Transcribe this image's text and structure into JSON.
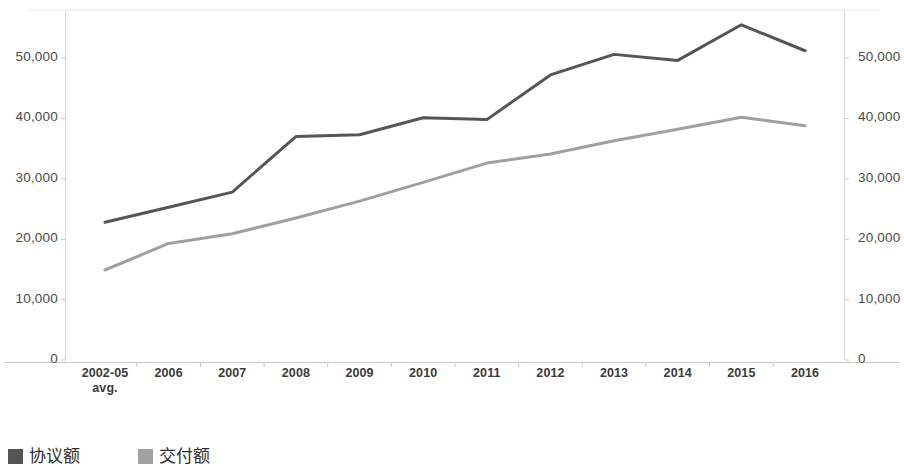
{
  "chart_data": {
    "type": "line",
    "title": "",
    "xlabel": "",
    "ylabel": "",
    "ylim": [
      0,
      55000
    ],
    "grid": false,
    "legend_position": "bottom-left",
    "dual_axis": true,
    "categories": [
      "2002-05\navg.",
      "2006",
      "2007",
      "2008",
      "2009",
      "2010",
      "2011",
      "2012",
      "2013",
      "2014",
      "2015",
      "2016"
    ],
    "series": [
      {
        "name": "协议额",
        "color": "#555555",
        "values": [
          22800,
          25300,
          27800,
          37000,
          37300,
          40100,
          39800,
          47200,
          50600,
          49600,
          55500,
          51200
        ]
      },
      {
        "name": "交付额",
        "color": "#a0a0a0",
        "values": [
          14900,
          19300,
          20900,
          23500,
          26300,
          29400,
          32600,
          34100,
          36300,
          38200,
          40200,
          38800
        ]
      }
    ],
    "yticks": [
      "0",
      "10,000",
      "20,000",
      "30,000",
      "40,000",
      "50,000"
    ],
    "ytick_values": [
      0,
      10000,
      20000,
      30000,
      40000,
      50000
    ]
  },
  "axes": {
    "left_ticks": [
      "50,000",
      "40,000",
      "30,000",
      "20,000",
      "10,000",
      "0"
    ],
    "right_ticks": [
      "50,000",
      "40,000",
      "30,000",
      "20,000",
      "10,000",
      "0"
    ]
  },
  "xaxis": {
    "labels": [
      {
        "main": "2002-05",
        "sub": "avg."
      },
      {
        "main": "2006",
        "sub": ""
      },
      {
        "main": "2007",
        "sub": ""
      },
      {
        "main": "2008",
        "sub": ""
      },
      {
        "main": "2009",
        "sub": ""
      },
      {
        "main": "2010",
        "sub": ""
      },
      {
        "main": "2011",
        "sub": ""
      },
      {
        "main": "2012",
        "sub": ""
      },
      {
        "main": "2013",
        "sub": ""
      },
      {
        "main": "2014",
        "sub": ""
      },
      {
        "main": "2015",
        "sub": ""
      },
      {
        "main": "2016",
        "sub": ""
      }
    ]
  },
  "legend": {
    "entries": [
      {
        "label": "协议额",
        "color": "#555555"
      },
      {
        "label": "交付额",
        "color": "#a0a0a0"
      }
    ]
  }
}
